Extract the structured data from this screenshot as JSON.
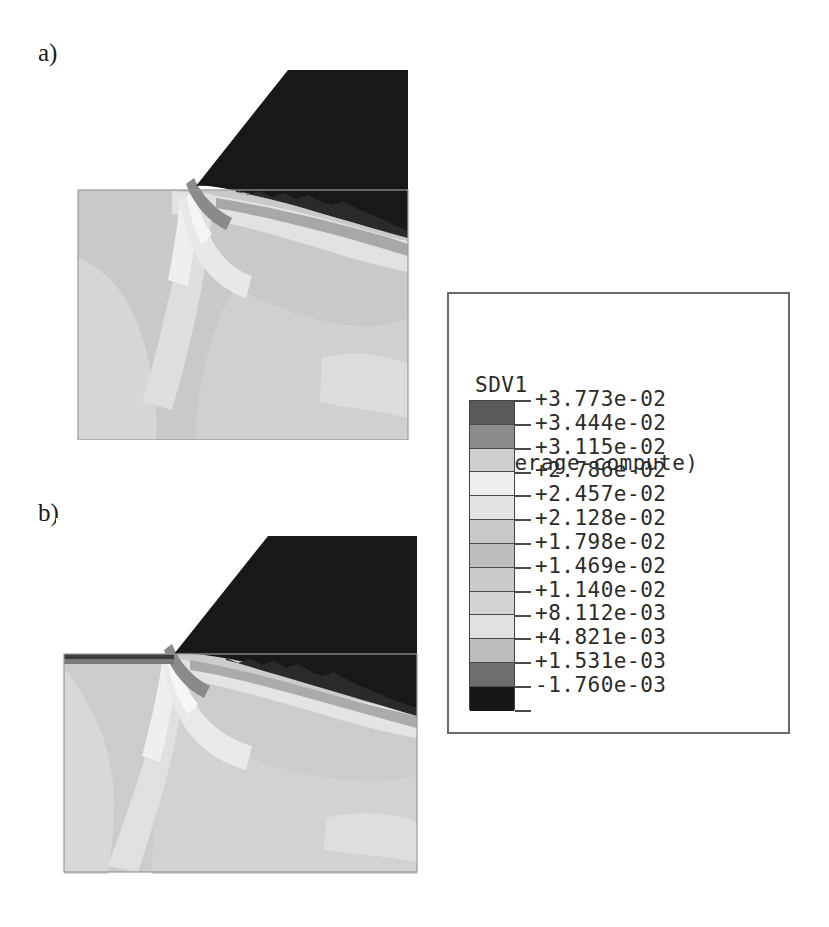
{
  "figure": {
    "panels": [
      {
        "label": "a)",
        "name": "panel-a"
      },
      {
        "label": "b)",
        "name": "panel-b"
      }
    ]
  },
  "legend": {
    "variable": "SDV1",
    "description": "(Average-compute)",
    "values": [
      "+3.773e-02",
      "+3.444e-02",
      "+3.115e-02",
      "+2.786e-02",
      "+2.457e-02",
      "+2.128e-02",
      "+1.798e-02",
      "+1.469e-02",
      "+1.140e-02",
      "+8.112e-03",
      "+4.821e-03",
      "+1.531e-03",
      "-1.760e-03"
    ],
    "swatch_colors": [
      "#5a5a5a",
      "#8c8c8c",
      "#cfcfcf",
      "#efefef",
      "#e3e3e3",
      "#c8c8c8",
      "#bdbdbd",
      "#cacaca",
      "#d4d4d4",
      "#e0e0e0",
      "#bcbcbc",
      "#6e6e6e",
      "#171717"
    ]
  },
  "chart_data": {
    "type": "heatmap",
    "xlabel": "",
    "ylabel": "",
    "colorbar": {
      "label": "SDV1",
      "sublabel": "(Average-compute)",
      "tick_labels": [
        "+3.773e-02",
        "+3.444e-02",
        "+3.115e-02",
        "+2.786e-02",
        "+2.457e-02",
        "+2.128e-02",
        "+1.798e-02",
        "+1.469e-02",
        "+1.140e-02",
        "+8.112e-03",
        "+4.821e-03",
        "+1.531e-03",
        "-1.760e-03"
      ],
      "tick_values": [
        0.03773,
        0.03444,
        0.03115,
        0.02786,
        0.02457,
        0.02128,
        0.01798,
        0.01469,
        0.0114,
        0.008112,
        0.004821,
        0.001531,
        -0.00176
      ],
      "band_count": 13,
      "vmin": -0.00176,
      "vmax": 0.03773,
      "colormap": "grayscale-banded",
      "position": "right"
    },
    "panels": [
      {
        "label": "a)",
        "description": "Orthogonal cutting contour: dark cutting tool wedge upper right, light gray workpiece, shear band from tool tip",
        "regions": [
          {
            "name": "tool",
            "value": -0.00176,
            "color": "#171717"
          },
          {
            "name": "workpiece-bulk",
            "value": 0.01798,
            "color": "#c4c4c4"
          },
          {
            "name": "free-surface-band",
            "value": 0.02457,
            "color": "#e3e3e3"
          },
          {
            "name": "shear-band",
            "value": 0.02786,
            "color": "#efefef"
          },
          {
            "name": "tool-contact-edge",
            "value": 0.001531,
            "color": "#6e6e6e"
          }
        ]
      },
      {
        "label": "b)",
        "description": "Same simulation at later increment: tool advanced, shear band extended deeper into workpiece",
        "regions": [
          {
            "name": "tool",
            "value": -0.00176,
            "color": "#171717"
          },
          {
            "name": "workpiece-bulk",
            "value": 0.01798,
            "color": "#c4c4c4"
          },
          {
            "name": "free-surface-band",
            "value": 0.02457,
            "color": "#e3e3e3"
          },
          {
            "name": "shear-band",
            "value": 0.02786,
            "color": "#efefef"
          },
          {
            "name": "tool-contact-edge",
            "value": 0.001531,
            "color": "#6e6e6e"
          }
        ]
      }
    ]
  }
}
